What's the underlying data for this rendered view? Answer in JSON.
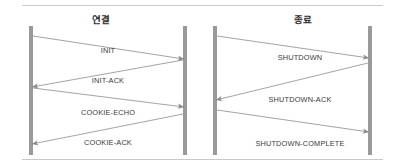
{
  "figure": {
    "type": "sequence-diagram",
    "width": 405,
    "height": 168,
    "background": "#ffffff",
    "rule_color": "#c9c9c9",
    "lifeline_color": "#9a9a9a",
    "arrow_color": "#8c8c8c",
    "text_color": "#3a3a3a",
    "title_color": "#2b2b2b"
  },
  "panels": [
    {
      "id": "association-setup",
      "title": "연결",
      "lifelines": [
        {
          "name": "client-lifeline",
          "x": 31,
          "y1": 26,
          "y2": 155,
          "width": 4
        },
        {
          "name": "server-lifeline",
          "x": 185,
          "y1": 26,
          "y2": 155,
          "width": 4
        }
      ],
      "messages": [
        {
          "label": "INIT",
          "direction": "left-to-right",
          "x1": 33,
          "y1": 36,
          "x2": 184,
          "y2": 59,
          "label_x": 108,
          "label_y": 46
        },
        {
          "label": "INIT-ACK",
          "direction": "right-to-left",
          "x1": 183,
          "y1": 60,
          "x2": 32,
          "y2": 87,
          "label_x": 108,
          "label_y": 76
        },
        {
          "label": "COOKIE-ECHO",
          "direction": "left-to-right",
          "x1": 33,
          "y1": 88,
          "x2": 184,
          "y2": 107,
          "label_x": 108,
          "label_y": 108
        },
        {
          "label": "COOKIE-ACK",
          "direction": "right-to-left",
          "x1": 183,
          "y1": 114,
          "x2": 32,
          "y2": 144,
          "label_x": 108,
          "label_y": 138
        }
      ]
    },
    {
      "id": "association-shutdown",
      "title": "종료",
      "lifelines": [
        {
          "name": "client-lifeline",
          "x": 215,
          "y1": 26,
          "y2": 155,
          "width": 4
        },
        {
          "name": "server-lifeline",
          "x": 370,
          "y1": 26,
          "y2": 155,
          "width": 4
        }
      ],
      "messages": [
        {
          "label": "SHUTDOWN",
          "direction": "left-to-right",
          "x1": 217,
          "y1": 36,
          "x2": 369,
          "y2": 58,
          "label_x": 300,
          "label_y": 53
        },
        {
          "label": "SHUTDOWN-ACK",
          "direction": "right-to-left",
          "x1": 368,
          "y1": 63,
          "x2": 216,
          "y2": 100,
          "label_x": 300,
          "label_y": 95
        },
        {
          "label": "SHUTDOWN-COMPLETE",
          "direction": "left-to-right",
          "x1": 217,
          "y1": 110,
          "x2": 369,
          "y2": 132,
          "label_x": 300,
          "label_y": 139
        }
      ]
    }
  ]
}
